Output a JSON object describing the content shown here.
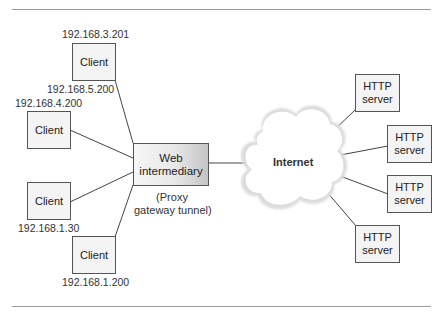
{
  "diagram": {
    "title": "",
    "clients": [
      {
        "label": "Client",
        "ip_above": "192.168.3.201",
        "ip_below": "192.168.5.200"
      },
      {
        "label": "Client",
        "ip_above": "192.168.4.200"
      },
      {
        "label": "Client",
        "ip_below": "192.168.1.30"
      },
      {
        "label": "Client",
        "ip_below": "192.168.1.200"
      }
    ],
    "intermediary": {
      "line1": "Web",
      "line2": "intermediary",
      "caption_line1": "(Proxy",
      "caption_line2": "gateway tunnel)"
    },
    "network": {
      "label": "Internet"
    },
    "servers": [
      {
        "line1": "HTTP",
        "line2": "server"
      },
      {
        "line1": "HTTP",
        "line2": "server"
      },
      {
        "line1": "HTTP",
        "line2": "server"
      },
      {
        "line1": "HTTP",
        "line2": "server"
      }
    ],
    "colors": {
      "box_border": "#555555",
      "box_fill": "#f4f4f4",
      "rule": "#9a9a9a",
      "line": "#444444"
    }
  }
}
